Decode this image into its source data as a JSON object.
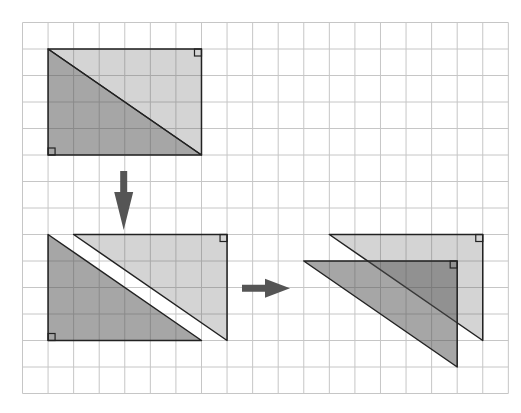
{
  "diagram": {
    "title": "Rectangle split along its diagonal into two right triangles, rearranged",
    "canvas": {
      "width": 521,
      "height": 413
    },
    "grid": {
      "origin_x": 22.5,
      "origin_y": 22.5,
      "cell_width": 25.57,
      "cell_height": 26.5,
      "columns": 19,
      "rows": 14,
      "line_color": "#c6c6c6"
    },
    "colors": {
      "dark_fill": "rgba(77,77,77,0.5)",
      "light_fill": "rgba(83,83,83,0.25)",
      "outline": "#222222",
      "arrow": "#555555"
    },
    "panels": [
      {
        "name": "step-1-rectangle",
        "triangles": [
          {
            "name": "light-triangle",
            "tone": "light",
            "cells": [
              [
                1,
                1
              ],
              [
                7,
                1
              ],
              [
                7,
                5
              ]
            ],
            "right_angle": {
              "corner": [
                7,
                1
              ],
              "dir": [
                -1,
                1
              ]
            }
          },
          {
            "name": "dark-triangle",
            "tone": "dark",
            "cells": [
              [
                1,
                1
              ],
              [
                1,
                5
              ],
              [
                7,
                5
              ]
            ],
            "right_angle": {
              "corner": [
                1,
                5
              ],
              "dir": [
                1,
                -1
              ]
            }
          }
        ]
      },
      {
        "name": "step-2-separated",
        "triangles": [
          {
            "name": "light-triangle",
            "tone": "light",
            "cells": [
              [
                2,
                8
              ],
              [
                8,
                8
              ],
              [
                8,
                12
              ]
            ],
            "right_angle": {
              "corner": [
                8,
                8
              ],
              "dir": [
                -1,
                1
              ]
            }
          },
          {
            "name": "dark-triangle",
            "tone": "dark",
            "cells": [
              [
                1,
                8
              ],
              [
                1,
                12
              ],
              [
                7,
                12
              ]
            ],
            "right_angle": {
              "corner": [
                1,
                12
              ],
              "dir": [
                1,
                -1
              ]
            }
          }
        ]
      },
      {
        "name": "step-3-rearranged",
        "triangles": [
          {
            "name": "light-triangle",
            "tone": "light",
            "cells": [
              [
                12,
                8
              ],
              [
                18,
                8
              ],
              [
                18,
                12
              ]
            ],
            "right_angle": {
              "corner": [
                18,
                8
              ],
              "dir": [
                -1,
                1
              ]
            }
          },
          {
            "name": "dark-triangle",
            "tone": "dark",
            "cells": [
              [
                11,
                9
              ],
              [
                17,
                9
              ],
              [
                17,
                13
              ]
            ],
            "right_angle": {
              "corner": [
                17,
                9
              ],
              "dir": [
                -1,
                1
              ]
            }
          }
        ]
      }
    ],
    "arrows": [
      {
        "name": "down-arrow",
        "direction": "down",
        "from": [
          123.7,
          171
        ],
        "to": [
          123.7,
          230
        ],
        "shaft_width": 7,
        "head_width": 19,
        "head_length": 38
      },
      {
        "name": "right-arrow",
        "direction": "right",
        "from": [
          242,
          288.3
        ],
        "to": [
          290,
          288.3
        ],
        "shaft_width": 7,
        "head_width": 19,
        "head_length": 25
      }
    ]
  }
}
